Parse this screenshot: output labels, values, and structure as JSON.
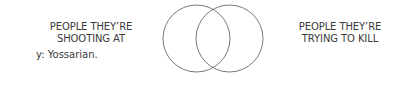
{
  "venn": {
    "left_set": {
      "label_lines": [
        "PEOPLE THEY’RE",
        "SHOOTING AT"
      ],
      "circle": {
        "cx": 196.5,
        "cy": 38.5,
        "r": 33.5
      }
    },
    "right_set": {
      "label_lines": [
        "PEOPLE THEY’RE",
        "TRYING TO KILL"
      ],
      "circle": {
        "cx": 229.5,
        "cy": 38.5,
        "r": 33.5
      }
    },
    "stroke_color": "#7a7a7a",
    "text_color": "#3a3a3a"
  },
  "footnote": "y: Yossarian."
}
